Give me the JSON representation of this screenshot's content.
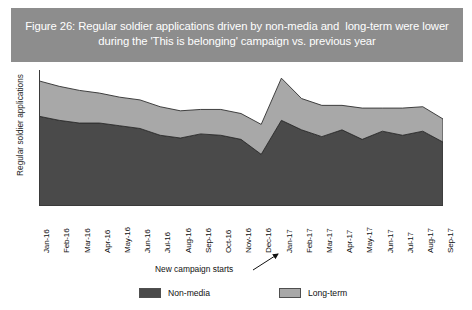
{
  "figure": {
    "title": "Figure 26: Regular soldier applications driven by non-media and  long-term were lower during the 'This is belonging' campaign vs. previous year",
    "title_color": "#8d8d8d",
    "title_text_color": "#ffffff"
  },
  "annotation": {
    "label": "New campaign starts",
    "points_to": "Jan-17"
  },
  "legend": {
    "position": "bottom",
    "entries": [
      {
        "label": "Non-media",
        "color": "#4a4a4a"
      },
      {
        "label": "Long-term",
        "color": "#a8a8a8"
      }
    ]
  },
  "chart_data": {
    "type": "area",
    "stacked": true,
    "title": "Figure 26: Regular soldier applications driven by non-media and  long-term were lower during the 'This is belonging' campaign vs. previous year",
    "xlabel": "",
    "ylabel": "Regular soldier applications",
    "grid": false,
    "ylim": [
      0,
      100
    ],
    "yticks_visible": false,
    "legend_position": "bottom",
    "categories": [
      "Jan-16",
      "Feb-16",
      "Mar-16",
      "Apr-16",
      "May-16",
      "Jun-16",
      "Jul-16",
      "Aug-16",
      "Sep-16",
      "Oct-16",
      "Nov-16",
      "Dec-16",
      "Jan-17",
      "Feb-17",
      "Mar-17",
      "Apr-17",
      "May-17",
      "Jun-17",
      "Jul-17",
      "Aug-17",
      "Sep-17"
    ],
    "series": [
      {
        "name": "Non-media",
        "color": "#4a4a4a",
        "values": [
          66,
          63,
          61,
          61,
          59,
          57,
          52,
          50,
          53,
          52,
          49,
          38,
          63,
          56,
          51,
          56,
          49,
          55,
          52,
          55,
          47
        ]
      },
      {
        "name": "Long-term",
        "color": "#a8a8a8",
        "values": [
          26,
          25,
          24,
          22,
          21,
          21,
          21,
          20,
          18,
          19,
          19,
          22,
          31,
          23,
          23,
          18,
          23,
          17,
          20,
          18,
          17
        ]
      }
    ],
    "totals": [
      92,
      88,
      85,
      83,
      80,
      78,
      73,
      70,
      71,
      71,
      68,
      60,
      94,
      79,
      74,
      74,
      72,
      72,
      72,
      73,
      64
    ],
    "annotations": [
      {
        "text": "New campaign starts",
        "target_category": "Jan-17"
      }
    ]
  }
}
